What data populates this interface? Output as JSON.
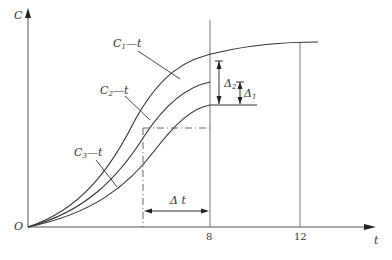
{
  "axes": {
    "y_label": "C",
    "x_label": "t",
    "origin_label": "O",
    "x_ticks": [
      "8",
      "12"
    ]
  },
  "curves": [
    {
      "label_main": "C",
      "label_sub": "1",
      "label_rest": "—t"
    },
    {
      "label_main": "C",
      "label_sub": "2",
      "label_rest": "—t"
    },
    {
      "label_main": "C",
      "label_sub": "3",
      "label_rest": "—t"
    }
  ],
  "annotations": {
    "delta2": {
      "main": "Δ",
      "sub": "2"
    },
    "delta1": {
      "main": "Δ",
      "sub": "1"
    },
    "delta_t": "Δ t"
  },
  "colors": {
    "line": "#333333",
    "grid": "#777777"
  }
}
